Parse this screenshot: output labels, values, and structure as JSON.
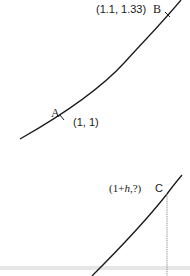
{
  "diagram": {
    "top_panel": {
      "curve": "increasing convex curve through points A and B",
      "points": [
        {
          "name": "A",
          "label": "A",
          "coord_label": "(1, 1)"
        },
        {
          "name": "B",
          "label": "B",
          "coord_label": "(1.1, 1.33)"
        }
      ]
    },
    "bottom_panel": {
      "curve": "increasing convex curve with point C and dotted vertical drop line",
      "points": [
        {
          "name": "C",
          "label": "C",
          "coord_label_prefix": "(1+",
          "coord_label_var": "h",
          "coord_label_suffix": ",?)"
        }
      ]
    },
    "colors": {
      "curve": "#1a1a1a",
      "dotted_line": "#888888",
      "band": "#e6e6e6",
      "background": "#ffffff"
    }
  }
}
